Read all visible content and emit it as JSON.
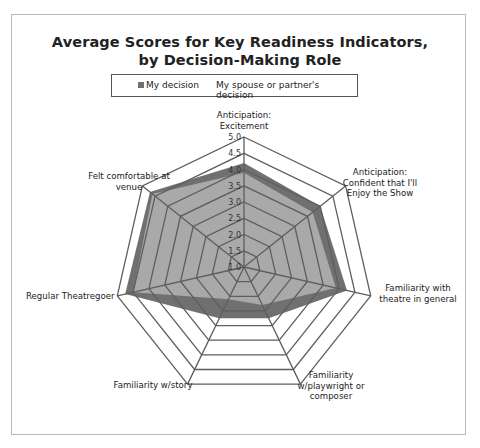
{
  "chart_data": {
    "type": "radar",
    "title_lines": [
      "Average Scores for Key Readiness Indicators,",
      "by Decision-Making Role"
    ],
    "axes": [
      {
        "label": [
          "Anticipation:",
          "Excitement"
        ]
      },
      {
        "label": [
          "Anticipation:",
          "Confident that I'll",
          "Enjoy the Show"
        ]
      },
      {
        "label": [
          "Familiarity with",
          "theatre in general"
        ]
      },
      {
        "label": [
          "Familiarity",
          "w/playwright or",
          "composer"
        ]
      },
      {
        "label": [
          "Familiarity w/story"
        ]
      },
      {
        "label": [
          "Regular Theatregoer"
        ]
      },
      {
        "label": [
          "Felt comfortable at",
          "venue"
        ]
      }
    ],
    "rlim": [
      1.0,
      5.0
    ],
    "ticks": [
      "1.0",
      "1.5",
      "2.0",
      "2.5",
      "3.0",
      "3.5",
      "4.0",
      "4.5",
      "5.0"
    ],
    "tick_values": [
      1.0,
      1.5,
      2.0,
      2.5,
      3.0,
      3.5,
      4.0,
      4.5,
      5.0
    ],
    "series": [
      {
        "name": "My decision",
        "color": "#707070",
        "values": [
          4.2,
          4.0,
          4.25,
          2.75,
          2.75,
          4.75,
          4.7
        ]
      },
      {
        "name": "My spouse or partner's decision",
        "color": "#a9a9a9",
        "values": [
          3.9,
          3.7,
          3.9,
          2.3,
          2.1,
          4.5,
          4.6
        ]
      }
    ],
    "legend_position": "top",
    "grid": true
  },
  "legend": {
    "items": [
      {
        "label": "My decision",
        "color": "#707070"
      },
      {
        "label": "My spouse or partner's decision",
        "color": "#a9a9a9"
      }
    ]
  }
}
